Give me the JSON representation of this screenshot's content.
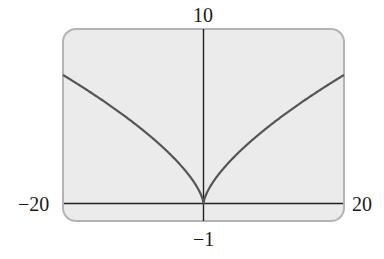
{
  "chart_data": {
    "type": "line",
    "title": "",
    "xlabel": "",
    "ylabel": "",
    "xlim": [
      -20,
      20
    ],
    "ylim": [
      -1,
      10
    ],
    "grid": false,
    "legend": null,
    "window_labels": {
      "xmin": "−20",
      "xmax": "20",
      "ymin": "−1",
      "ymax": "10"
    },
    "series": [
      {
        "name": "y = x^(2/3)",
        "description": "cusp at origin, symmetric",
        "x": [
          -20,
          -15,
          -10,
          -5,
          -2,
          -1,
          0,
          1,
          2,
          5,
          10,
          15,
          20
        ],
        "y": [
          7.37,
          6.08,
          4.64,
          2.92,
          1.59,
          1.0,
          0,
          1.0,
          1.59,
          2.92,
          4.64,
          6.08,
          7.37
        ]
      }
    ],
    "colors": {
      "background": "#ebebeb",
      "border": "#b4b4b4",
      "axis": "#222222",
      "curve": "#555555"
    }
  }
}
